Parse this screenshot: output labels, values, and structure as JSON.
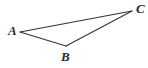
{
  "figure": {
    "name": "triangle-abc",
    "background_color": "#ffffff",
    "width": 148,
    "height": 68,
    "stroke_color": "#333333",
    "stroke_width": 1.1,
    "label_color": "#2b2b2b"
  },
  "vertices": [
    {
      "id": "A",
      "label": "A",
      "x": 20,
      "y": 32,
      "label_x": 8,
      "label_y": 24
    },
    {
      "id": "B",
      "label": "B",
      "x": 66,
      "y": 46,
      "label_x": 61,
      "label_y": 50
    },
    {
      "id": "C",
      "label": "C",
      "x": 132,
      "y": 11,
      "label_x": 136,
      "label_y": 2
    }
  ],
  "edges": [
    {
      "id": "AC",
      "from": "A",
      "to": "C",
      "x1": 20,
      "y1": 32,
      "x2": 132,
      "y2": 11
    },
    {
      "id": "AB",
      "from": "A",
      "to": "B",
      "x1": 20,
      "y1": 32,
      "x2": 66,
      "y2": 46
    },
    {
      "id": "BC",
      "from": "B",
      "to": "C",
      "x1": 66,
      "y1": 46,
      "x2": 132,
      "y2": 11
    }
  ],
  "chart_data": {
    "type": "diagram",
    "title": "",
    "shape": "triangle",
    "points": {
      "A": [
        20,
        32
      ],
      "B": [
        66,
        46
      ],
      "C": [
        132,
        11
      ]
    },
    "point_labels": [
      "A",
      "B",
      "C"
    ],
    "segments": [
      [
        "A",
        "C"
      ],
      [
        "A",
        "B"
      ],
      [
        "B",
        "C"
      ]
    ],
    "xlabel": "",
    "ylabel": ""
  }
}
